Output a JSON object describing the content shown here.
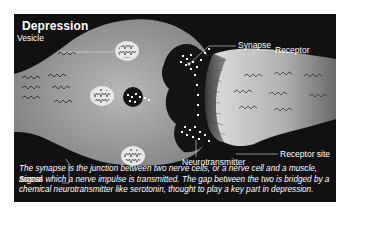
{
  "diagram": {
    "title": "Depression",
    "labels": {
      "vesicle": "Vesicle",
      "signal": "Signal",
      "synapse": "Synapse",
      "receptor": "Receptor",
      "receptor_site": "Receptor site",
      "neurotransmitter": "Neurotransmitter"
    },
    "caption": "The synapse is the junction between two nerve cells, or a nerve cell and a muscle, across which a nerve impulse is transmitted.  The gap between the two is bridged by a chemical neurotransmitter like serotonin, thought to play a key part in depression.",
    "colors": {
      "background": "#111111",
      "cell_light": "#c8c8c8",
      "cell_dark": "#8a8a8a",
      "text": "#ffffff"
    }
  }
}
